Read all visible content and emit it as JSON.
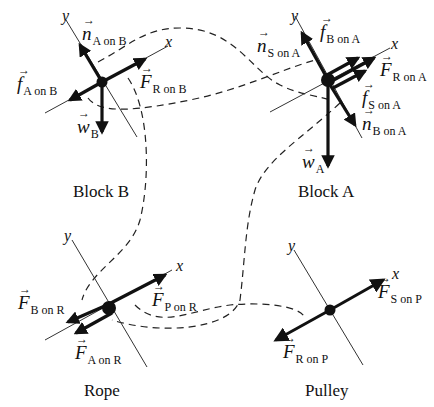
{
  "diagram": {
    "panels": [
      {
        "id": "block-b",
        "title": "Block B",
        "axes": {
          "x": "x",
          "y": "y"
        },
        "forces": [
          {
            "symbol": "n",
            "subscript": "A on B"
          },
          {
            "symbol": "F",
            "subscript": "R on B"
          },
          {
            "symbol": "f",
            "subscript": "A on B"
          },
          {
            "symbol": "w",
            "subscript": "B"
          }
        ]
      },
      {
        "id": "block-a",
        "title": "Block A",
        "axes": {
          "x": "x",
          "y": "y"
        },
        "forces": [
          {
            "symbol": "n",
            "subscript": "S on A"
          },
          {
            "symbol": "f",
            "subscript": "B on A"
          },
          {
            "symbol": "F",
            "subscript": "R on A"
          },
          {
            "symbol": "f",
            "subscript": "S on A"
          },
          {
            "symbol": "n",
            "subscript": "B on A"
          },
          {
            "symbol": "w",
            "subscript": "A"
          }
        ]
      },
      {
        "id": "rope",
        "title": "Rope",
        "axes": {
          "x": "x",
          "y": "y"
        },
        "forces": [
          {
            "symbol": "F",
            "subscript": "B on R"
          },
          {
            "symbol": "F",
            "subscript": "P on R"
          },
          {
            "symbol": "F",
            "subscript": "A on R"
          }
        ]
      },
      {
        "id": "pulley",
        "title": "Pulley",
        "axes": {
          "x": "x",
          "y": "y"
        },
        "forces": [
          {
            "symbol": "F",
            "subscript": "S on P"
          },
          {
            "symbol": "F",
            "subscript": "R on P"
          }
        ]
      }
    ],
    "interaction_pairs": [
      [
        "n A on B",
        "n B on A"
      ],
      [
        "f A on B",
        "f B on A"
      ],
      [
        "F R on B",
        "F B on R"
      ],
      [
        "F R on A",
        "F A on R"
      ],
      [
        "F P on R",
        "F R on P"
      ]
    ],
    "colors": {
      "ink": "#111111",
      "background": "#ffffff"
    }
  }
}
